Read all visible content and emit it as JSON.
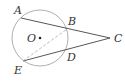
{
  "diagram": {
    "type": "geometry",
    "circle": {
      "center_label": "O",
      "cx": 40,
      "cy": 38,
      "r": 28
    },
    "points": [
      {
        "label": "A",
        "x": 21,
        "y": 18,
        "lx": 14,
        "ly": 14
      },
      {
        "label": "B",
        "x": 67,
        "y": 29,
        "lx": 68,
        "ly": 25
      },
      {
        "label": "C",
        "x": 110,
        "y": 38,
        "lx": 114,
        "ly": 42
      },
      {
        "label": "D",
        "x": 66,
        "y": 50,
        "lx": 67,
        "ly": 61
      },
      {
        "label": "E",
        "x": 23,
        "y": 61,
        "lx": 14,
        "ly": 74
      },
      {
        "label": "O",
        "x": 40,
        "y": 38,
        "lx": 27,
        "ly": 42
      }
    ],
    "segments": [
      {
        "from": "A",
        "to": "C",
        "style": "solid"
      },
      {
        "from": "E",
        "to": "C",
        "style": "solid"
      },
      {
        "from": "E",
        "to": "B",
        "style": "dashed"
      }
    ]
  }
}
